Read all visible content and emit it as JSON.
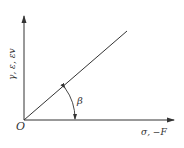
{
  "diagram": {
    "origin_label": "O",
    "x_axis_label": "σ, −F",
    "y_axis_label": "γ, ε, εv",
    "angle_label": "β",
    "colors": {
      "stroke": "#333333",
      "background": "#ffffff"
    },
    "line": {
      "from": [
        24,
        120
      ],
      "to": [
        127,
        31
      ]
    }
  }
}
